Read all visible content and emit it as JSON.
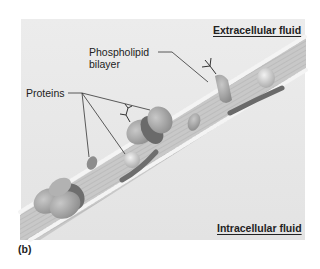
{
  "diagram": {
    "type": "cell membrane cross-section",
    "regions": {
      "extracellular": "Extracellular fluid",
      "intracellular": "Intracellular fluid"
    },
    "labels": {
      "phospholipid_line1": "Phospholipid",
      "phospholipid_line2": "bilayer",
      "proteins": "Proteins"
    },
    "figure_label": "(b)",
    "colors": {
      "background": "#e6e6e6",
      "membrane": "#c9c9c9",
      "protein": "#a9a9a9",
      "protein_dark": "#7a7a7a"
    }
  }
}
